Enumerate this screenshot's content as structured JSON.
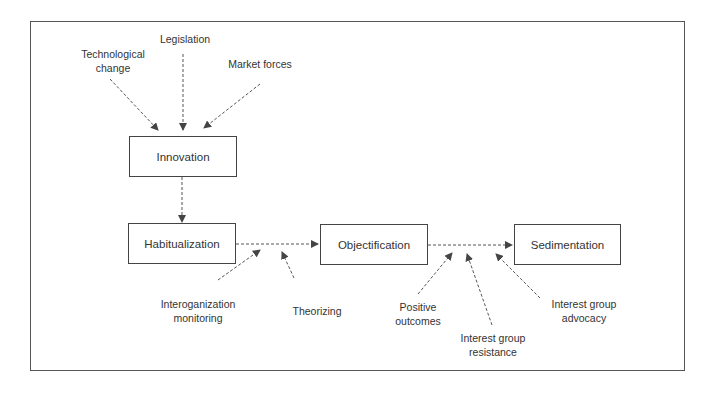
{
  "diagram": {
    "boxes": {
      "innovation": "Innovation",
      "habitualization": "Habitualization",
      "objectification": "Objectification",
      "sedimentation": "Sedimentation"
    },
    "influences": {
      "technological_change": [
        "Technological",
        "change"
      ],
      "legislation": "Legislation",
      "market_forces": "Market forces",
      "interorganization_monitoring": [
        "Interoganization",
        "monitoring"
      ],
      "theorizing": "Theorizing",
      "positive_outcomes": [
        "Positive",
        "outcomes"
      ],
      "interest_group_resistance": [
        "Interest group",
        "resistance"
      ],
      "interest_group_advocacy": [
        "Interest group",
        "advocacy"
      ]
    },
    "colors": {
      "line": "#444444",
      "text": "#333333",
      "background": "#ffffff"
    }
  }
}
